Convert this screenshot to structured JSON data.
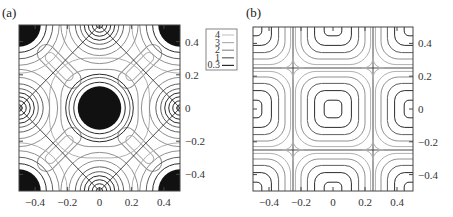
{
  "chart_data": [
    {
      "type": "heatmap",
      "panel": "(a)",
      "title": "",
      "xlabel": "",
      "ylabel": "",
      "xlim": [
        -0.5,
        0.5
      ],
      "ylim": [
        -0.5,
        0.5
      ],
      "xticks": [
        "-0.4",
        "-0.2",
        "0",
        "0.2",
        "0.4"
      ],
      "yticks": [
        "0.4",
        "0.2",
        "0",
        "-0.2",
        "-0.4"
      ],
      "grid": false,
      "contour_levels": [
        "4",
        "3",
        "2",
        "1",
        "0.3"
      ],
      "features": {
        "filled_blobs": [
          {
            "x": 0,
            "y": 0,
            "r": 0.135
          },
          {
            "x": -0.5,
            "y": 0.5,
            "r": 0.135
          },
          {
            "x": 0.5,
            "y": 0.5,
            "r": 0.135
          },
          {
            "x": -0.5,
            "y": -0.5,
            "r": 0.135
          },
          {
            "x": 0.5,
            "y": -0.5,
            "r": 0.135
          }
        ],
        "saddle_points": [
          {
            "x": 0,
            "y": 0.5
          },
          {
            "x": 0,
            "y": -0.5
          },
          {
            "x": -0.5,
            "y": 0
          },
          {
            "x": 0.5,
            "y": 0
          }
        ],
        "diagonal_separatrix": "diamond through (0,±0.5) and (±0.5,0)"
      }
    },
    {
      "type": "heatmap",
      "panel": "(b)",
      "title": "",
      "xlabel": "",
      "ylabel": "",
      "xlim": [
        -0.5,
        0.5
      ],
      "ylim": [
        -0.5,
        0.5
      ],
      "xticks": [
        "-0.4",
        "-0.2",
        "0",
        "0.2",
        "0.4"
      ],
      "yticks": [
        "0.4",
        "0.2",
        "0",
        "-0.2",
        "-0.4"
      ],
      "grid": false,
      "contour_levels": [
        "4",
        "3",
        "2",
        "1",
        "0.3"
      ],
      "features": {
        "separatrix_lines_x": [
          -0.25,
          0.25
        ],
        "separatrix_lines_y": [
          -0.25,
          0.25
        ],
        "rounded_square_centers": [
          {
            "x": 0,
            "y": 0
          },
          {
            "x": 0.5,
            "y": 0
          },
          {
            "x": -0.5,
            "y": 0
          },
          {
            "x": 0,
            "y": 0.5
          },
          {
            "x": 0,
            "y": -0.5
          },
          {
            "x": 0.5,
            "y": 0.5
          },
          {
            "x": -0.5,
            "y": 0.5
          },
          {
            "x": 0.5,
            "y": -0.5
          },
          {
            "x": -0.5,
            "y": -0.5
          }
        ]
      }
    }
  ],
  "panels": {
    "a": {
      "label": "(a)"
    },
    "b": {
      "label": "(b)"
    }
  },
  "legend": {
    "entries": [
      {
        "label": "4",
        "color": "#c8c8c8"
      },
      {
        "label": "3",
        "color": "#b0b0b0"
      },
      {
        "label": "2",
        "color": "#909090"
      },
      {
        "label": "1",
        "color": "#606060"
      },
      {
        "label": "0.3",
        "color": "#2a2a2a"
      }
    ]
  },
  "axis": {
    "xticks": [
      {
        "value": -0.4,
        "label": "−0.4"
      },
      {
        "value": -0.2,
        "label": "−0.2"
      },
      {
        "value": 0,
        "label": "0"
      },
      {
        "value": 0.2,
        "label": "0.2"
      },
      {
        "value": 0.4,
        "label": "0.4"
      }
    ],
    "yticks": [
      {
        "value": 0.4,
        "label": "0.4"
      },
      {
        "value": 0.2,
        "label": "0.2"
      },
      {
        "value": 0,
        "label": "0"
      },
      {
        "value": -0.2,
        "label": "−0.2"
      },
      {
        "value": -0.4,
        "label": "−0.4"
      }
    ]
  }
}
